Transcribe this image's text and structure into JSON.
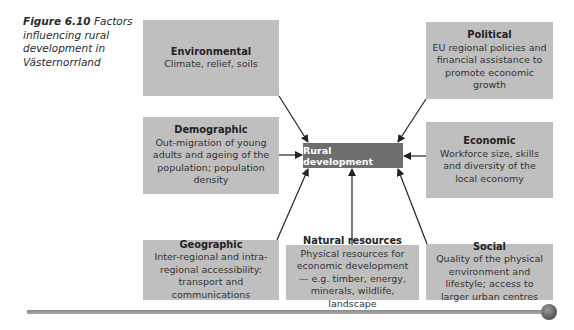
{
  "caption": {
    "figure_label": "Figure 6.10",
    "text": "Factors influencing rural development in Västernorrland"
  },
  "center": {
    "label": "Rural development"
  },
  "factors": [
    {
      "id": "environmental",
      "title": "Environmental",
      "desc": "Climate, relief, soils"
    },
    {
      "id": "political",
      "title": "Political",
      "desc": "EU regional policies and financial assistance to promote economic growth"
    },
    {
      "id": "demographic",
      "title": "Demographic",
      "desc": "Out-migration of young adults and ageing of the population; population density"
    },
    {
      "id": "economic",
      "title": "Economic",
      "desc": "Workforce size, skills and diversity of the local economy"
    },
    {
      "id": "geographic",
      "title": "Geographic",
      "desc": "Inter-regional and intra-regional accessibility: transport and communications"
    },
    {
      "id": "natural-resources",
      "title": "Natural resources",
      "desc": "Physical resources for economic development — e.g. timber, energy, minerals, wildlife, landscape"
    },
    {
      "id": "social",
      "title": "Social",
      "desc": "Quality of the physical environment and lifestyle; access to larger urban centres"
    }
  ],
  "colors": {
    "box": "#bfbfbf",
    "center": "#6e6e6e",
    "arrow": "#222222"
  }
}
